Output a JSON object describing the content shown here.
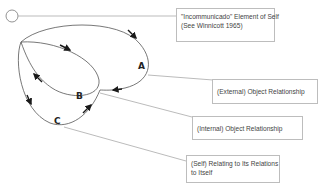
{
  "diagram": {
    "nodes": {
      "A": {
        "label": "A"
      },
      "B": {
        "label": "B"
      },
      "C": {
        "label": "C"
      }
    },
    "callouts": [
      {
        "id": "incommunicado",
        "line1": "\"Incommunicado\" Element of Self",
        "line2": "(See Winnicott 1965)"
      },
      {
        "id": "external",
        "line1": "(External) Object Relationship"
      },
      {
        "id": "internal",
        "line1": "(Internal) Object Relationship"
      },
      {
        "id": "self",
        "line1": "(Self) Relating to Its Relations",
        "line2": "to Itself"
      }
    ],
    "colors": {
      "stroke": "#555555",
      "arrow": "#1a1a1a",
      "leader": "#9e9e9e",
      "box_border": "#bdbdbd"
    }
  }
}
